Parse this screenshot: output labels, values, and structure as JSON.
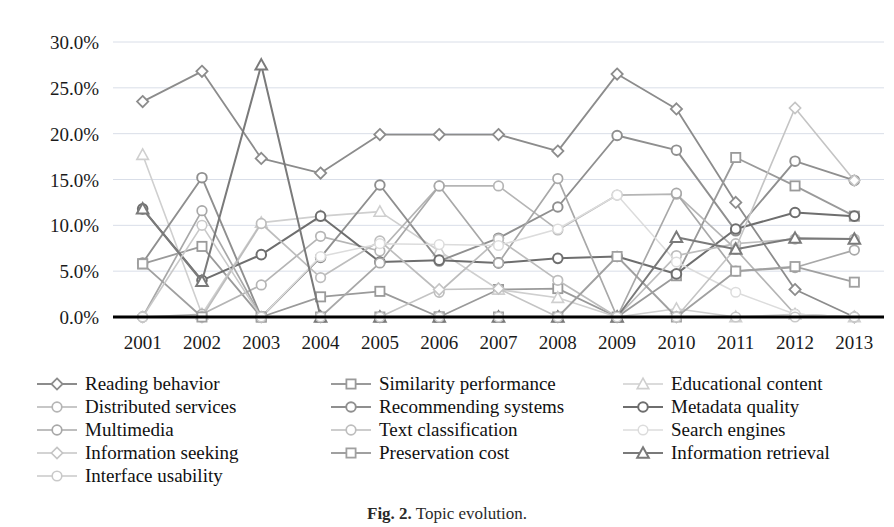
{
  "chart_data": {
    "type": "line",
    "title": "",
    "xlabel": "",
    "ylabel": "",
    "categories": [
      "2001",
      "2002",
      "2003",
      "2004",
      "2005",
      "2006",
      "2007",
      "2008",
      "2009",
      "2010",
      "2011",
      "2012",
      "2013"
    ],
    "ylim": [
      0,
      30
    ],
    "ytick_labels": [
      "0.0%",
      "5.0%",
      "10.0%",
      "15.0%",
      "20.0%",
      "25.0%",
      "30.0%"
    ],
    "ytick_values": [
      0,
      5,
      10,
      15,
      20,
      25,
      30
    ],
    "grid": true,
    "legend_position": "bottom",
    "value_suffix": "%",
    "series": [
      {
        "name": "Reading behavior",
        "marker": "diamond",
        "color": "#8c8c8c",
        "width": 1.8,
        "values": [
          23.5,
          26.8,
          17.3,
          15.7,
          19.9,
          19.9,
          19.9,
          18.1,
          26.5,
          22.7,
          12.5,
          3.0,
          0.0
        ]
      },
      {
        "name": "Similarity performance",
        "marker": "square",
        "color": "#9a9a9a",
        "width": 1.8,
        "values": [
          5.8,
          7.7,
          0.0,
          2.2,
          2.8,
          0.0,
          3.0,
          3.1,
          0.0,
          4.5,
          17.4,
          14.3,
          11.0
        ]
      },
      {
        "name": "Educational content",
        "marker": "triangle",
        "color": "#cfcfcf",
        "width": 1.6,
        "values": [
          17.7,
          0.3,
          10.3,
          11.0,
          11.5,
          7.2,
          3.0,
          2.1,
          0.0,
          0.9,
          0.0,
          0.3,
          0.0
        ]
      },
      {
        "name": "Distributed services",
        "marker": "circle",
        "color": "#b5b5b5",
        "width": 1.7,
        "values": [
          0.0,
          0.3,
          3.5,
          8.8,
          7.2,
          14.3,
          14.3,
          9.5,
          13.3,
          13.4,
          7.4,
          0.3,
          0.0
        ]
      },
      {
        "name": "Recommending systems",
        "marker": "circle",
        "color": "#8f8f8f",
        "width": 1.9,
        "values": [
          5.9,
          15.2,
          0.0,
          6.5,
          14.4,
          6.1,
          8.6,
          12.0,
          19.8,
          18.2,
          9.4,
          17.0,
          14.9
        ]
      },
      {
        "name": "Metadata quality",
        "marker": "circle",
        "color": "#6e6e6e",
        "width": 2.0,
        "values": [
          11.8,
          4.0,
          6.8,
          11.0,
          6.0,
          6.2,
          5.9,
          6.4,
          6.6,
          4.7,
          9.6,
          11.4,
          11.0
        ]
      },
      {
        "name": "Multimedia",
        "marker": "circle",
        "color": "#a8a8a8",
        "width": 1.7,
        "values": [
          0.0,
          11.6,
          0.0,
          0.0,
          5.9,
          14.3,
          5.9,
          15.1,
          0.0,
          13.5,
          5.0,
          5.4,
          7.3
        ]
      },
      {
        "name": "Text classification",
        "marker": "circle",
        "color": "#bdbdbd",
        "width": 1.7,
        "values": [
          0.0,
          0.0,
          10.2,
          4.3,
          8.3,
          2.7,
          8.5,
          4.0,
          0.0,
          6.7,
          8.0,
          8.5,
          8.5
        ]
      },
      {
        "name": "Search engines",
        "marker": "circle",
        "color": "#dcdcdc",
        "width": 1.5,
        "values": [
          0.0,
          0.0,
          0.0,
          6.6,
          8.0,
          7.9,
          7.8,
          9.6,
          13.3,
          6.0,
          2.7,
          0.3,
          0.0
        ]
      },
      {
        "name": "Information seeking",
        "marker": "diamond",
        "color": "#c4c4c4",
        "width": 1.6,
        "values": [
          0.0,
          0.0,
          0.0,
          0.0,
          0.0,
          3.0,
          3.1,
          0.0,
          0.0,
          0.0,
          7.5,
          22.8,
          14.9
        ]
      },
      {
        "name": "Preservation cost",
        "marker": "square",
        "color": "#a0a0a0",
        "width": 1.8,
        "values": [
          5.8,
          0.0,
          0.0,
          0.0,
          0.0,
          0.0,
          0.0,
          0.0,
          6.6,
          0.0,
          5.0,
          5.5,
          3.8
        ]
      },
      {
        "name": "Information retrieval",
        "marker": "triangle",
        "color": "#7a7a7a",
        "width": 2.0,
        "values": [
          11.8,
          3.9,
          27.5,
          0.0,
          0.0,
          0.0,
          0.0,
          0.0,
          0.0,
          8.7,
          7.4,
          8.6,
          8.5
        ]
      },
      {
        "name": "Interface usability",
        "marker": "circle",
        "color": "#c9c9c9",
        "width": 1.6,
        "values": [
          0.0,
          10.0,
          0.0,
          0.0,
          0.0,
          0.0,
          0.0,
          0.0,
          0.0,
          0.0,
          0.0,
          0.0,
          0.0
        ]
      }
    ]
  },
  "legend": {
    "columns": [
      [
        "Reading behavior",
        "Distributed services",
        "Multimedia",
        "Information seeking",
        "Interface usability"
      ],
      [
        "Similarity performance",
        "Recommending systems",
        "Text classification",
        "Preservation cost"
      ],
      [
        "Educational content",
        "Metadata quality",
        "Search engines",
        "Information retrieval"
      ]
    ]
  },
  "caption": {
    "figure_number": "Fig. 2.",
    "text": " Topic evolution."
  },
  "colors": {
    "axis": "#000000",
    "grid": "#d9dee8",
    "background": "#ffffff",
    "text": "#1a1a1a"
  }
}
